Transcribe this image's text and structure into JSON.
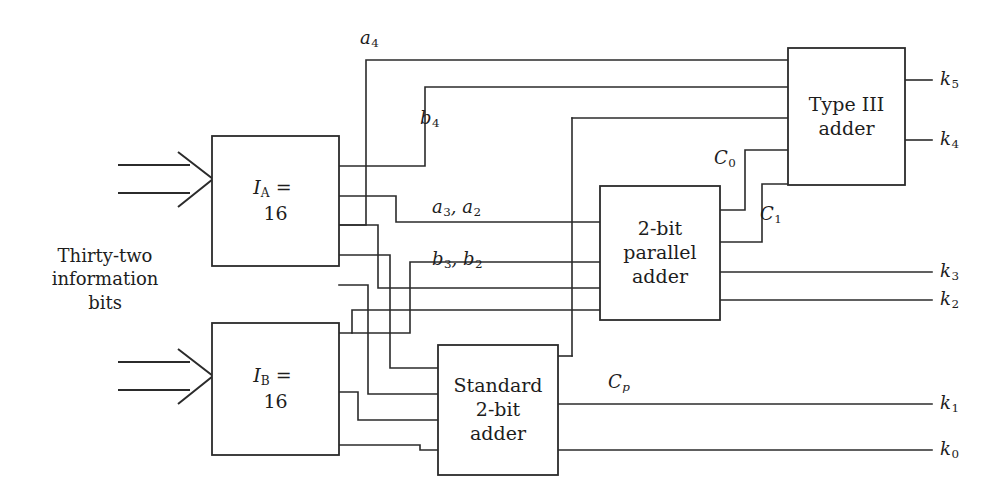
{
  "figure": {
    "type": "block-diagram",
    "background_color": "#ffffff",
    "line_color": "#2b2b2b"
  },
  "input_caption": {
    "line1": "Thirty-two",
    "line2": "information",
    "line3": "bits"
  },
  "blocks": [
    {
      "id": "ia",
      "name": "block-ia",
      "lines": [
        "I_A = 16"
      ],
      "symbol": "I",
      "subscript": "A",
      "value": "16",
      "x": 212,
      "y": 136,
      "w": 127,
      "h": 130
    },
    {
      "id": "ib",
      "name": "block-ib",
      "lines": [
        "I_B = 16"
      ],
      "symbol": "I",
      "subscript": "B",
      "value": "16",
      "x": 212,
      "y": 323,
      "w": 127,
      "h": 132
    },
    {
      "id": "standard-adder",
      "name": "block-standard-2bit-adder",
      "lines": [
        "Standard",
        "2-bit",
        "adder"
      ],
      "x": 438,
      "y": 345,
      "w": 120,
      "h": 130
    },
    {
      "id": "parallel-adder",
      "name": "block-2bit-parallel-adder",
      "lines": [
        "2-bit",
        "parallel",
        "adder"
      ],
      "x": 600,
      "y": 186,
      "w": 120,
      "h": 134
    },
    {
      "id": "type3-adder",
      "name": "block-type-iii-adder",
      "lines": [
        "Type III",
        "adder"
      ],
      "x": 788,
      "y": 48,
      "w": 117,
      "h": 137
    }
  ],
  "signal_labels": [
    {
      "name": "label-a4",
      "base": "a",
      "sub": "4",
      "x": 360,
      "y": 28
    },
    {
      "name": "label-b4",
      "base": "b",
      "sub": "4",
      "x": 420,
      "y": 108
    },
    {
      "name": "label-a3-a2",
      "base": "a",
      "sub": "3",
      "base2": "a",
      "sub2": "2",
      "x": 434,
      "y": 196
    },
    {
      "name": "label-b3-b2",
      "base": "b",
      "sub": "3",
      "base2": "b",
      "sub2": "2",
      "x": 434,
      "y": 248
    },
    {
      "name": "label-c0",
      "base": "C",
      "sub": "0",
      "x": 716,
      "y": 148
    },
    {
      "name": "label-c1",
      "base": "C",
      "sub": "1",
      "x": 762,
      "y": 204
    },
    {
      "name": "label-cp",
      "base": "C",
      "sub": "p",
      "sub_italic": true,
      "x": 610,
      "y": 372
    }
  ],
  "outputs": [
    {
      "name": "output-k5",
      "base": "k",
      "sub": "5",
      "x": 940,
      "y": 68,
      "stub_x1": 905,
      "stub_x2": 932,
      "wire_from": 905
    },
    {
      "name": "output-k4",
      "base": "k",
      "sub": "4",
      "x": 940,
      "y": 130,
      "stub_x1": 905,
      "stub_x2": 932,
      "wire_from": 905
    },
    {
      "name": "output-k3",
      "base": "k",
      "sub": "3",
      "x": 940,
      "y": 260,
      "stub_x1": 720,
      "stub_x2": 932,
      "wire_from": 720
    },
    {
      "name": "output-k2",
      "base": "k",
      "sub": "2",
      "x": 940,
      "y": 290,
      "stub_x1": 720,
      "stub_x2": 932,
      "wire_from": 720
    },
    {
      "name": "output-k1",
      "base": "k",
      "sub": "1",
      "x": 940,
      "y": 392,
      "stub_x1": 558,
      "stub_x2": 932,
      "wire_from": 558
    },
    {
      "name": "output-k0",
      "base": "k",
      "sub": "0",
      "x": 940,
      "y": 438,
      "stub_x1": 558,
      "stub_x2": 932,
      "wire_from": 558
    }
  ],
  "input_arrows": [
    {
      "name": "input-arrow-ia",
      "top_y": 165,
      "bottom_y": 193,
      "x1": 118,
      "x2": 186,
      "tip_x": 213,
      "mid_y": 179
    },
    {
      "name": "input-arrow-ib",
      "top_y": 362,
      "bottom_y": 390,
      "x1": 118,
      "x2": 186,
      "tip_x": 213,
      "mid_y": 376
    }
  ],
  "wires": [
    {
      "name": "wire-a4",
      "d": "M 339 225 L 366 225 L 366 60 L 788 60"
    },
    {
      "name": "wire-b4",
      "d": "M 339 166 L 425 166 L 425 87 L 788 87"
    },
    {
      "name": "wire-ia-mid",
      "d": "M 339 196 L 396 196 L 396 222 L 600 222"
    },
    {
      "name": "wire-a3a2",
      "d": "M 339 225 L 378 225 L 378 285 L 600 285"
    },
    {
      "name": "wire-vert-572",
      "d": "M 572 118 L 572 315"
    },
    {
      "name": "wire-572-top",
      "d": "M 572 118 L 788 118"
    },
    {
      "name": "wire-b3b2-drop",
      "d": "M 339 333 L 352 333 L 352 310 L 572 310"
    },
    {
      "name": "wire-ib-a",
      "d": "M 339 333 L 410 333 L 410 282 L 600 282"
    },
    {
      "name": "wire-ib-b",
      "d": "M 339 392 L 370 392 L 370 368 L 438 368"
    },
    {
      "name": "wire-ib-c",
      "d": "M 339 445 L 360 445 L 360 420 L 438 420"
    },
    {
      "name": "wire-std-up",
      "d": "M 558 355 L 572 355 L 572 315"
    },
    {
      "name": "wire-c0",
      "d": "M 720 210 L 745 210 L 745 150 L 788 150"
    },
    {
      "name": "wire-c1",
      "d": "M 720 242 L 762 242 L 762 184 L 788 184"
    },
    {
      "name": "wire-ia-to-std",
      "d": "M 339 255 L 390 255 L 390 395 L 438 395"
    },
    {
      "name": "wire-ia-to-std2",
      "d": "M 339 196 L 404 196 L 404 448 L 438 448"
    }
  ]
}
